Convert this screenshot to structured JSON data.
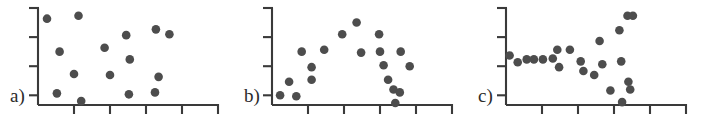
{
  "figure": {
    "type": "multi-panel-scatter-figure",
    "panel_count": 3,
    "background_color": "#ffffff",
    "marker_color": "#4d4d4d",
    "axis_color": "#3a3a3a"
  },
  "chart_data": [
    {
      "type": "scatter",
      "panel_label": "a)",
      "title": "",
      "xlabel": "",
      "ylabel": "",
      "xlim": [
        0,
        20
      ],
      "ylim": [
        0,
        10
      ],
      "grid": false,
      "legend": "none",
      "axis": {
        "y_tick_count": 4,
        "y_ticks": [
          1,
          4,
          7,
          10
        ],
        "x_tick_count": 4,
        "x_ticks": [
          4,
          8,
          12,
          16
        ]
      },
      "points": [
        {
          "x": 1.0,
          "y": 8.9
        },
        {
          "x": 2.4,
          "y": 5.5
        },
        {
          "x": 2.1,
          "y": 1.2
        },
        {
          "x": 4.5,
          "y": 9.2
        },
        {
          "x": 4.0,
          "y": 3.2
        },
        {
          "x": 4.8,
          "y": 0.4
        },
        {
          "x": 7.4,
          "y": 5.9
        },
        {
          "x": 8.0,
          "y": 3.1
        },
        {
          "x": 9.8,
          "y": 7.2
        },
        {
          "x": 10.2,
          "y": 4.7
        },
        {
          "x": 10.1,
          "y": 1.1
        },
        {
          "x": 13.1,
          "y": 7.8
        },
        {
          "x": 13.4,
          "y": 2.9
        },
        {
          "x": 13.0,
          "y": 1.3
        },
        {
          "x": 14.6,
          "y": 7.3
        }
      ]
    },
    {
      "type": "scatter",
      "panel_label": "b)",
      "title": "",
      "xlabel": "",
      "ylabel": "",
      "xlim": [
        0,
        20
      ],
      "ylim": [
        0,
        10
      ],
      "grid": false,
      "legend": "none",
      "axis": {
        "y_tick_count": 4,
        "y_ticks": [
          1,
          4,
          7,
          10
        ],
        "x_tick_count": 4,
        "x_ticks": [
          4,
          8,
          12,
          16
        ]
      },
      "points": [
        {
          "x": 0.9,
          "y": 1.0
        },
        {
          "x": 1.9,
          "y": 2.4
        },
        {
          "x": 2.7,
          "y": 0.9
        },
        {
          "x": 3.3,
          "y": 5.5
        },
        {
          "x": 4.4,
          "y": 3.9
        },
        {
          "x": 4.4,
          "y": 2.6
        },
        {
          "x": 5.8,
          "y": 5.7
        },
        {
          "x": 7.8,
          "y": 7.3
        },
        {
          "x": 9.4,
          "y": 8.5
        },
        {
          "x": 9.9,
          "y": 5.4
        },
        {
          "x": 11.9,
          "y": 7.3
        },
        {
          "x": 12.0,
          "y": 5.5
        },
        {
          "x": 12.4,
          "y": 4.1
        },
        {
          "x": 12.9,
          "y": 2.6
        },
        {
          "x": 13.5,
          "y": 1.6
        },
        {
          "x": 13.7,
          "y": 0.2
        },
        {
          "x": 14.3,
          "y": 5.5
        },
        {
          "x": 14.2,
          "y": 1.3
        },
        {
          "x": 15.3,
          "y": 4.0
        }
      ]
    },
    {
      "type": "scatter",
      "panel_label": "c)",
      "title": "",
      "xlabel": "",
      "ylabel": "",
      "xlim": [
        0,
        20
      ],
      "ylim": [
        0,
        10
      ],
      "grid": false,
      "legend": "none",
      "axis": {
        "y_tick_count": 4,
        "y_ticks": [
          1,
          4,
          7,
          10
        ],
        "x_tick_count": 4,
        "x_ticks": [
          4,
          8,
          12,
          16
        ]
      },
      "points": [
        {
          "x": 0.4,
          "y": 5.1
        },
        {
          "x": 1.3,
          "y": 4.4
        },
        {
          "x": 2.3,
          "y": 4.7
        },
        {
          "x": 3.1,
          "y": 4.7
        },
        {
          "x": 4.1,
          "y": 4.7
        },
        {
          "x": 5.2,
          "y": 4.8
        },
        {
          "x": 5.7,
          "y": 5.7
        },
        {
          "x": 5.9,
          "y": 3.9
        },
        {
          "x": 7.1,
          "y": 5.7
        },
        {
          "x": 8.3,
          "y": 4.5
        },
        {
          "x": 8.6,
          "y": 3.5
        },
        {
          "x": 9.8,
          "y": 3.1
        },
        {
          "x": 10.4,
          "y": 6.6
        },
        {
          "x": 10.7,
          "y": 4.2
        },
        {
          "x": 11.6,
          "y": 1.5
        },
        {
          "x": 12.6,
          "y": 7.7
        },
        {
          "x": 12.8,
          "y": 4.5
        },
        {
          "x": 13.5,
          "y": 9.2
        },
        {
          "x": 14.1,
          "y": 9.2
        },
        {
          "x": 13.6,
          "y": 2.4
        },
        {
          "x": 13.8,
          "y": 1.6
        },
        {
          "x": 12.9,
          "y": 0.3
        }
      ]
    }
  ]
}
